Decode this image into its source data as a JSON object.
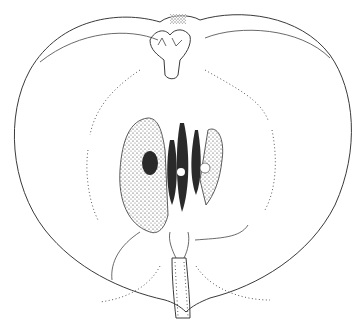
{
  "image": {
    "subject": "Apple longitudinal cross-section line drawing",
    "style": "pen-and-ink stipple illustration",
    "colors": {
      "background": "#ffffff",
      "ink": "#2a2a2a"
    },
    "parts": [
      "calyx",
      "flesh outline",
      "core line (dotted)",
      "seed cavities",
      "seeds",
      "core",
      "stem"
    ]
  }
}
